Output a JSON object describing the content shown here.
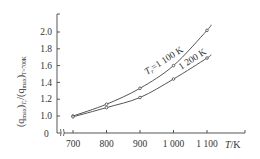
{
  "chart_data": {
    "type": "line",
    "title": "",
    "xlabel": "T/K",
    "ylabel": "(q_max)_Tr / (q_max)_Tr=700K",
    "x": [
      700,
      800,
      900,
      1000,
      1100
    ],
    "x_tick_labels": [
      "700",
      "800",
      "900",
      "1 000",
      "1 100"
    ],
    "y_tick_labels": [
      "0",
      "1.0",
      "1.2",
      "1.4",
      "1.6",
      "1.8",
      "2.0"
    ],
    "y_ticks": [
      0,
      1.0,
      1.2,
      1.4,
      1.6,
      1.8,
      2.0
    ],
    "ylim": [
      0,
      2.2
    ],
    "axis_break_x": true,
    "grid": false,
    "legend": "none (inline annotations)",
    "series": [
      {
        "name": "T_r=1 100 K",
        "label": "1 100 K",
        "values": [
          1.0,
          1.14,
          1.33,
          1.6,
          2.02
        ]
      },
      {
        "name": "T_r=1 200 K",
        "label": "1 200 K",
        "values": [
          0.99,
          1.1,
          1.22,
          1.44,
          1.69
        ]
      }
    ],
    "annotations": [
      "T_r=1 100 K",
      "1 200 K"
    ]
  },
  "labels": {
    "xlabel_T": "T",
    "xlabel_unit": "/K",
    "ylabel_q1": "(q",
    "ylabel_max": "max",
    "ylabel_tr": "T",
    "ylabel_r": "r",
    "ylabel_div": ")/(q",
    "ylabel_sub2": "T=700K",
    "anno1_T": "T",
    "anno1_r": "r",
    "anno1_rest": "=1 100 K",
    "anno2": "1 200 K",
    "zero": "0"
  }
}
